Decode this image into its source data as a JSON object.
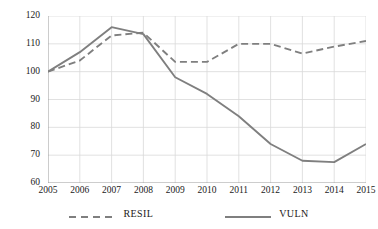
{
  "chart_data": {
    "type": "line",
    "title": "",
    "xlabel": "",
    "ylabel": "",
    "categories": [
      "2005",
      "2006",
      "2007",
      "2008",
      "2009",
      "2010",
      "2011",
      "2012",
      "2013",
      "2014",
      "2015"
    ],
    "x": [
      2005,
      2006,
      2007,
      2008,
      2009,
      2010,
      2011,
      2012,
      2013,
      2014,
      2015
    ],
    "ylim": [
      60,
      120
    ],
    "yticks": [
      60,
      70,
      80,
      90,
      100,
      110,
      120
    ],
    "ytick_labels": [
      "60",
      "70",
      "80",
      "90",
      "100",
      "110",
      "120"
    ],
    "xtick_labels": [
      "2005",
      "2006",
      "2007",
      "2008",
      "2009",
      "2010",
      "2011",
      "2012",
      "2013",
      "2014",
      "2015"
    ],
    "grid": true,
    "grid_color": "#d9d9d9",
    "legend_position": "bottom",
    "series": [
      {
        "name": "RESIL",
        "style": "dashed",
        "color": "#7f7f7f",
        "values": [
          100,
          104,
          113,
          114,
          103.5,
          103.5,
          110,
          110,
          106.5,
          109,
          111
        ]
      },
      {
        "name": "VULN",
        "style": "solid",
        "color": "#7f7f7f",
        "values": [
          100,
          107,
          116,
          113.5,
          98,
          92,
          84,
          74,
          68,
          67.5,
          74
        ]
      }
    ]
  },
  "legend": {
    "items": [
      {
        "label": "RESIL",
        "style": "dashed"
      },
      {
        "label": "VULN",
        "style": "solid"
      }
    ]
  }
}
